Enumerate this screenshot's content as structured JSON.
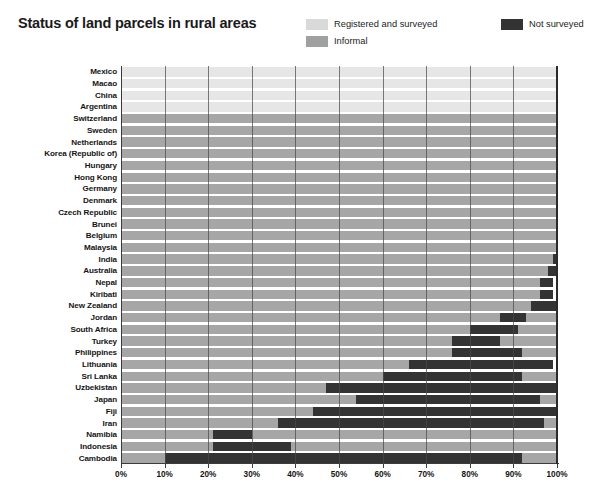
{
  "header": {
    "title": "Status of land parcels in rural areas"
  },
  "legend": {
    "position": "top-right",
    "entries": [
      {
        "id": "registered",
        "label": "Registered and surveyed",
        "color": "#d9d9d9"
      },
      {
        "id": "informal",
        "label": "Informal",
        "color": "#a0a0a0"
      },
      {
        "id": "not_surveyed",
        "label": "Not surveyed",
        "color": "#333333"
      }
    ]
  },
  "colors": {
    "registered": "#e6e6e6",
    "informal": "#a6a6a6",
    "not_surveyed": "#333333",
    "gridline": "#4a4a4a",
    "axis": "#3c3c3c",
    "text": "#151515",
    "background": "#ffffff"
  },
  "axis": {
    "x_ticks": [
      "0%",
      "10%",
      "20%",
      "30%",
      "40%",
      "50%",
      "60%",
      "70%",
      "80%",
      "90%",
      "100%"
    ],
    "x_tick_values": [
      0,
      10,
      20,
      30,
      40,
      50,
      60,
      70,
      80,
      90,
      100
    ],
    "xlim": [
      0,
      100
    ]
  },
  "chart_data": {
    "type": "bar",
    "orientation": "horizontal",
    "stacked": true,
    "stack_total": 100,
    "title": "Status of land parcels in rural areas",
    "xlabel": "",
    "ylabel": "",
    "xlim": [
      0,
      100
    ],
    "grid": true,
    "legend_position": "top-right",
    "units": "percent",
    "categories": [
      "Mexico",
      "Macao",
      "China",
      "Argentina",
      "Switzerland",
      "Sweden",
      "Netherlands",
      "Korea (Republic of)",
      "Hungary",
      "Hong Kong",
      "Germany",
      "Denmark",
      "Czech Republic",
      "Brunei",
      "Belgium",
      "Malaysia",
      "India",
      "Australia",
      "Nepal",
      "Kiribati",
      "New Zealand",
      "Jordan",
      "South Africa",
      "Turkey",
      "Philippines",
      "Lithuania",
      "Sri Lanka",
      "Uzbekistan",
      "Japan",
      "Fiji",
      "Iran",
      "Namibia",
      "Indonesia",
      "Cambodia"
    ],
    "series": [
      {
        "name": "Registered and surveyed",
        "color": "#e6e6e6",
        "values": [
          100,
          100,
          100,
          100,
          0,
          0,
          0,
          0,
          0,
          0,
          0,
          0,
          0,
          0,
          0,
          0,
          0,
          0,
          0,
          0,
          0,
          0,
          0,
          0,
          0,
          0,
          0,
          0,
          0,
          0,
          0,
          0,
          0,
          0
        ]
      },
      {
        "name": "Informal",
        "color": "#a6a6a6",
        "values": [
          0,
          0,
          0,
          0,
          100,
          100,
          100,
          100,
          100,
          100,
          100,
          100,
          100,
          100,
          100,
          100,
          99,
          98,
          97,
          97,
          96,
          94,
          89,
          89,
          84,
          78,
          72,
          65,
          56,
          58,
          50,
          70,
          68,
          10
        ]
      },
      {
        "name": "Not surveyed",
        "color": "#333333",
        "values": [
          0,
          0,
          0,
          0,
          0,
          0,
          0,
          0,
          0,
          0,
          0,
          0,
          0,
          0,
          0,
          0,
          1,
          2,
          3,
          3,
          4,
          6,
          11,
          11,
          16,
          22,
          28,
          35,
          44,
          42,
          50,
          30,
          32,
          90
        ]
      }
    ],
    "rows": [
      {
        "category": "Mexico",
        "registered": 100,
        "informal": 0,
        "not_surveyed": 0,
        "segments": [
          {
            "series": "registered",
            "start": 0,
            "end": 100
          }
        ]
      },
      {
        "category": "Macao",
        "registered": 100,
        "informal": 0,
        "not_surveyed": 0,
        "segments": [
          {
            "series": "registered",
            "start": 0,
            "end": 100
          }
        ]
      },
      {
        "category": "China",
        "registered": 100,
        "informal": 0,
        "not_surveyed": 0,
        "segments": [
          {
            "series": "registered",
            "start": 0,
            "end": 100
          }
        ]
      },
      {
        "category": "Argentina",
        "registered": 100,
        "informal": 0,
        "not_surveyed": 0,
        "segments": [
          {
            "series": "registered",
            "start": 0,
            "end": 100
          }
        ]
      },
      {
        "category": "Switzerland",
        "registered": 0,
        "informal": 100,
        "not_surveyed": 0,
        "segments": [
          {
            "series": "informal",
            "start": 0,
            "end": 100
          }
        ]
      },
      {
        "category": "Sweden",
        "registered": 0,
        "informal": 100,
        "not_surveyed": 0,
        "segments": [
          {
            "series": "informal",
            "start": 0,
            "end": 100
          }
        ]
      },
      {
        "category": "Netherlands",
        "registered": 0,
        "informal": 100,
        "not_surveyed": 0,
        "segments": [
          {
            "series": "informal",
            "start": 0,
            "end": 100
          }
        ]
      },
      {
        "category": "Korea (Republic of)",
        "registered": 0,
        "informal": 100,
        "not_surveyed": 0,
        "segments": [
          {
            "series": "informal",
            "start": 0,
            "end": 100
          }
        ]
      },
      {
        "category": "Hungary",
        "registered": 0,
        "informal": 100,
        "not_surveyed": 0,
        "segments": [
          {
            "series": "informal",
            "start": 0,
            "end": 100
          }
        ]
      },
      {
        "category": "Hong Kong",
        "registered": 0,
        "informal": 100,
        "not_surveyed": 0,
        "segments": [
          {
            "series": "informal",
            "start": 0,
            "end": 100
          }
        ]
      },
      {
        "category": "Germany",
        "registered": 0,
        "informal": 100,
        "not_surveyed": 0,
        "segments": [
          {
            "series": "informal",
            "start": 0,
            "end": 100
          }
        ]
      },
      {
        "category": "Denmark",
        "registered": 0,
        "informal": 100,
        "not_surveyed": 0,
        "segments": [
          {
            "series": "informal",
            "start": 0,
            "end": 100
          }
        ]
      },
      {
        "category": "Czech Republic",
        "registered": 0,
        "informal": 100,
        "not_surveyed": 0,
        "segments": [
          {
            "series": "informal",
            "start": 0,
            "end": 100
          }
        ]
      },
      {
        "category": "Brunei",
        "registered": 0,
        "informal": 100,
        "not_surveyed": 0,
        "segments": [
          {
            "series": "informal",
            "start": 0,
            "end": 100
          }
        ]
      },
      {
        "category": "Belgium",
        "registered": 0,
        "informal": 100,
        "not_surveyed": 0,
        "segments": [
          {
            "series": "informal",
            "start": 0,
            "end": 100
          }
        ]
      },
      {
        "category": "Malaysia",
        "registered": 0,
        "informal": 100,
        "not_surveyed": 0,
        "segments": [
          {
            "series": "informal",
            "start": 0,
            "end": 100
          }
        ]
      },
      {
        "category": "India",
        "registered": 0,
        "informal": 99,
        "not_surveyed": 1,
        "segments": [
          {
            "series": "informal",
            "start": 0,
            "end": 99
          },
          {
            "series": "not_surveyed",
            "start": 99,
            "end": 100
          }
        ]
      },
      {
        "category": "Australia",
        "registered": 0,
        "informal": 98,
        "not_surveyed": 2,
        "segments": [
          {
            "series": "informal",
            "start": 0,
            "end": 98
          },
          {
            "series": "not_surveyed",
            "start": 98,
            "end": 100
          }
        ]
      },
      {
        "category": "Nepal",
        "registered": 0,
        "informal": 97,
        "not_surveyed": 3,
        "segments": [
          {
            "series": "informal",
            "start": 0,
            "end": 96
          },
          {
            "series": "not_surveyed",
            "start": 96,
            "end": 99
          }
        ]
      },
      {
        "category": "Kiribati",
        "registered": 0,
        "informal": 97,
        "not_surveyed": 3,
        "segments": [
          {
            "series": "informal",
            "start": 0,
            "end": 96
          },
          {
            "series": "not_surveyed",
            "start": 96,
            "end": 99
          }
        ]
      },
      {
        "category": "New Zealand",
        "registered": 0,
        "informal": 96,
        "not_surveyed": 4,
        "segments": [
          {
            "series": "informal",
            "start": 0,
            "end": 94
          },
          {
            "series": "not_surveyed",
            "start": 94,
            "end": 100
          }
        ]
      },
      {
        "category": "Jordan",
        "registered": 0,
        "informal": 94,
        "not_surveyed": 6,
        "segments": [
          {
            "series": "informal",
            "start": 0,
            "end": 87
          },
          {
            "series": "not_surveyed",
            "start": 87,
            "end": 93
          },
          {
            "series": "informal",
            "start": 93,
            "end": 100
          }
        ]
      },
      {
        "category": "South Africa",
        "registered": 0,
        "informal": 89,
        "not_surveyed": 11,
        "segments": [
          {
            "series": "informal",
            "start": 0,
            "end": 80
          },
          {
            "series": "not_surveyed",
            "start": 80,
            "end": 91
          },
          {
            "series": "informal",
            "start": 91,
            "end": 100
          }
        ]
      },
      {
        "category": "Turkey",
        "registered": 0,
        "informal": 89,
        "not_surveyed": 11,
        "segments": [
          {
            "series": "informal",
            "start": 0,
            "end": 76
          },
          {
            "series": "not_surveyed",
            "start": 76,
            "end": 87
          },
          {
            "series": "informal",
            "start": 87,
            "end": 100
          }
        ]
      },
      {
        "category": "Philippines",
        "registered": 0,
        "informal": 84,
        "not_surveyed": 16,
        "segments": [
          {
            "series": "informal",
            "start": 0,
            "end": 76
          },
          {
            "series": "not_surveyed",
            "start": 76,
            "end": 92
          },
          {
            "series": "informal",
            "start": 92,
            "end": 100
          }
        ]
      },
      {
        "category": "Lithuania",
        "registered": 0,
        "informal": 78,
        "not_surveyed": 22,
        "segments": [
          {
            "series": "informal",
            "start": 0,
            "end": 66
          },
          {
            "series": "not_surveyed",
            "start": 66,
            "end": 99
          }
        ]
      },
      {
        "category": "Sri Lanka",
        "registered": 0,
        "informal": 72,
        "not_surveyed": 28,
        "segments": [
          {
            "series": "informal",
            "start": 0,
            "end": 60
          },
          {
            "series": "not_surveyed",
            "start": 60,
            "end": 92
          },
          {
            "series": "informal",
            "start": 92,
            "end": 100
          }
        ]
      },
      {
        "category": "Uzbekistan",
        "registered": 0,
        "informal": 65,
        "not_surveyed": 35,
        "segments": [
          {
            "series": "informal",
            "start": 0,
            "end": 47
          },
          {
            "series": "not_surveyed",
            "start": 47,
            "end": 100
          }
        ]
      },
      {
        "category": "Japan",
        "registered": 0,
        "informal": 56,
        "not_surveyed": 44,
        "segments": [
          {
            "series": "informal",
            "start": 0,
            "end": 54
          },
          {
            "series": "not_surveyed",
            "start": 54,
            "end": 96
          },
          {
            "series": "informal",
            "start": 96,
            "end": 100
          }
        ]
      },
      {
        "category": "Fiji",
        "registered": 0,
        "informal": 58,
        "not_surveyed": 42,
        "segments": [
          {
            "series": "informal",
            "start": 0,
            "end": 44
          },
          {
            "series": "not_surveyed",
            "start": 44,
            "end": 100
          }
        ]
      },
      {
        "category": "Iran",
        "registered": 0,
        "informal": 50,
        "not_surveyed": 50,
        "segments": [
          {
            "series": "informal",
            "start": 0,
            "end": 36
          },
          {
            "series": "not_surveyed",
            "start": 36,
            "end": 97
          },
          {
            "series": "informal",
            "start": 97,
            "end": 100
          }
        ]
      },
      {
        "category": "Namibia",
        "registered": 0,
        "informal": 70,
        "not_surveyed": 30,
        "segments": [
          {
            "series": "informal",
            "start": 0,
            "end": 21
          },
          {
            "series": "not_surveyed",
            "start": 21,
            "end": 30
          },
          {
            "series": "informal",
            "start": 30,
            "end": 100
          }
        ]
      },
      {
        "category": "Indonesia",
        "registered": 0,
        "informal": 68,
        "not_surveyed": 32,
        "segments": [
          {
            "series": "informal",
            "start": 0,
            "end": 21
          },
          {
            "series": "not_surveyed",
            "start": 21,
            "end": 39
          },
          {
            "series": "informal",
            "start": 39,
            "end": 100
          }
        ]
      },
      {
        "category": "Cambodia",
        "registered": 0,
        "informal": 10,
        "not_surveyed": 90,
        "segments": [
          {
            "series": "informal",
            "start": 0,
            "end": 10
          },
          {
            "series": "not_surveyed",
            "start": 10,
            "end": 92
          },
          {
            "series": "informal",
            "start": 92,
            "end": 100
          }
        ]
      }
    ]
  }
}
